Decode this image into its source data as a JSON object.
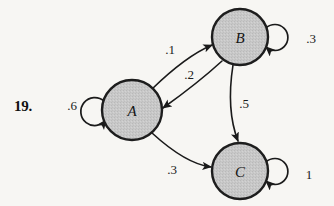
{
  "exercise": {
    "number": "19."
  },
  "diagram": {
    "type": "state-transition-diagram",
    "background_color": "#f7f6f3",
    "node_fill_color": "#c8c8c8",
    "node_stroke_color": "#1d1d1d",
    "edge_color": "#1a1a1a",
    "nodes": [
      {
        "id": "A",
        "label": "A",
        "cx": 132,
        "cy": 110,
        "r": 30
      },
      {
        "id": "B",
        "label": "B",
        "cx": 240,
        "cy": 37,
        "r": 28
      },
      {
        "id": "C",
        "label": "C",
        "cx": 240,
        "cy": 171,
        "r": 28
      }
    ],
    "edges": [
      {
        "from": "A",
        "to": "B",
        "weight": ".1",
        "label_x": 170,
        "label_y": 54
      },
      {
        "from": "B",
        "to": "A",
        "weight": ".2",
        "label_x": 189,
        "label_y": 79
      },
      {
        "from": "B",
        "to": "C",
        "weight": ".5",
        "label_x": 244,
        "label_y": 108
      },
      {
        "from": "A",
        "to": "C",
        "weight": ".3",
        "label_x": 172,
        "label_y": 174
      }
    ],
    "self_loops": [
      {
        "node": "A",
        "weight": ".6",
        "side": "left",
        "label_x": 72,
        "label_y": 110
      },
      {
        "node": "B",
        "weight": ".3",
        "side": "right",
        "label_x": 311,
        "label_y": 43
      },
      {
        "node": "C",
        "weight": "1",
        "side": "right",
        "label_x": 309,
        "label_y": 179
      }
    ]
  }
}
